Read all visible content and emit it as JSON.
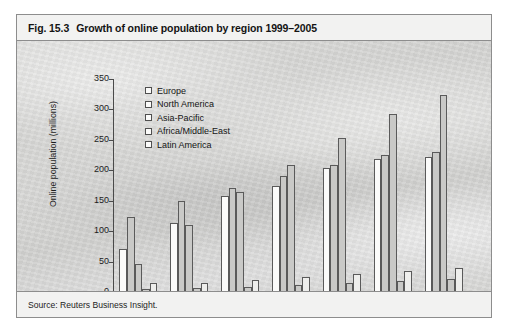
{
  "figure": {
    "number": "Fig. 15.3",
    "title": "Growth of online population by region 1999–2005",
    "source": "Source: Reuters Business Insight."
  },
  "chart_data": {
    "type": "bar",
    "title": "Growth of online population by region 1999–2005",
    "xlabel": "",
    "ylabel": "Online population (millions)",
    "categories": [
      "1999",
      "2000",
      "2001",
      "2002",
      "2003",
      "2004",
      "2005"
    ],
    "ylim": [
      0,
      350
    ],
    "yticks": [
      0,
      50,
      100,
      150,
      200,
      250,
      300,
      350
    ],
    "grid": false,
    "legend_position": "top-left",
    "series": [
      {
        "name": "Europe",
        "values": [
          70,
          113,
          157,
          175,
          203,
          218,
          222
        ]
      },
      {
        "name": "North America",
        "values": [
          123,
          150,
          171,
          190,
          208,
          225,
          230
        ]
      },
      {
        "name": "Asia-Pacific",
        "values": [
          46,
          110,
          165,
          208,
          253,
          292,
          323
        ]
      },
      {
        "name": "Africa/Middle-East",
        "values": [
          5,
          6,
          8,
          12,
          15,
          18,
          22
        ]
      },
      {
        "name": "Latin America",
        "values": [
          14,
          15,
          20,
          25,
          30,
          35,
          40
        ]
      }
    ]
  }
}
